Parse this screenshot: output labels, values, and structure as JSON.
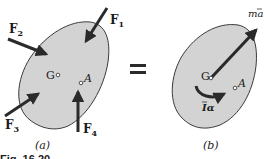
{
  "figure": {
    "caption": "Fig. 16.20",
    "equals_sign": "=",
    "colors": {
      "body_fill": "#d3d3d3",
      "body_stroke": "#3a3a3a",
      "arrow": "#2a2a2a",
      "background": "#ffffff"
    }
  },
  "panel_a": {
    "label": "(a)",
    "point_g": "G",
    "point_a": "A",
    "forces": [
      {
        "name": "F",
        "subscript": "1"
      },
      {
        "name": "F",
        "subscript": "2"
      },
      {
        "name": "F",
        "subscript": "3"
      },
      {
        "name": "F",
        "subscript": "4"
      }
    ]
  },
  "panel_b": {
    "label": "(b)",
    "point_g": "G",
    "point_a": "A",
    "vector_label": {
      "m": "m",
      "a": "a",
      "bar": "‾"
    },
    "couple_label": {
      "I": "I",
      "alpha": "α"
    }
  }
}
